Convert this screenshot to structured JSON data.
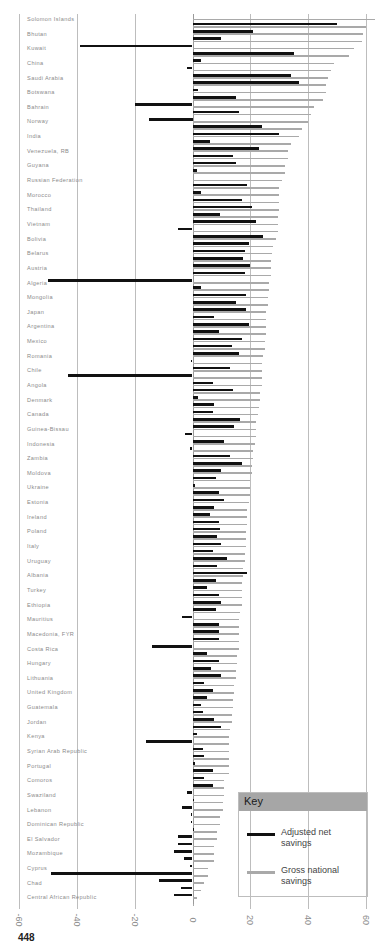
{
  "chart_data": {
    "type": "bar",
    "orientation": "horizontal",
    "title": "",
    "xlabel": "",
    "ylabel": "",
    "xlim": [
      -60,
      60
    ],
    "xticks": [
      "-60",
      "-40",
      "-20",
      "0",
      "20",
      "40",
      "60"
    ],
    "grid": true,
    "legend_position": "bottom-right",
    "legend_title": "Key",
    "series_names": [
      "Adjusted net savings",
      "Gross national savings"
    ],
    "series_colors": [
      "#111111",
      "#a9a9a9"
    ],
    "row_labels": [
      "Solomon Islands",
      "",
      "Bhutan",
      "",
      "Kuwait",
      "",
      "China",
      "",
      "Saudi Arabia",
      "",
      "Botswana",
      "",
      "Bahrain",
      "",
      "Norway",
      "",
      "India",
      "",
      "Venezuela, RB",
      "",
      "Guyana",
      "",
      "Russian Federation",
      "",
      "Morocco",
      "",
      "Thailand",
      "",
      "Vietnam",
      "",
      "Bolivia",
      "",
      "Belarus",
      "",
      "Austria",
      "",
      "Algeria",
      "",
      "Mongolia",
      "",
      "Japan",
      "",
      "Argentina",
      "",
      "Mexico",
      "",
      "Romania",
      "",
      "Chile",
      "",
      "Angola",
      "",
      "Denmark",
      "",
      "Canada",
      "",
      "Guinea-Bissau",
      "",
      "Indonesia",
      "",
      "Zambia",
      "",
      "Moldova",
      "",
      "Ukraine",
      "",
      "Estonia",
      "",
      "Ireland",
      "",
      "Poland",
      "",
      "Italy",
      "",
      "Uruguay",
      "",
      "Albania",
      "",
      "Turkey",
      "",
      "Ethiopia",
      "",
      "Mauritius",
      "",
      "Macedonia, FYR",
      "",
      "Costa Rica",
      "",
      "Hungary",
      "",
      "Lithuania",
      "",
      "United Kingdom",
      "",
      "Guatemala",
      "",
      "Jordan",
      "",
      "Kenya",
      "",
      "Syrian Arab Republic",
      "",
      "Portugal",
      "",
      "Comoros",
      "",
      "Swaziland",
      "",
      "Lebanon",
      "",
      "Dominican Republic",
      "",
      "El Salvador",
      "",
      "Mozambique",
      "",
      "Cyprus",
      "",
      "Chad",
      "",
      "Central African Republic",
      ""
    ],
    "series": [
      {
        "name": "Adjusted net savings",
        "values": [
          0,
          50,
          21,
          10,
          -39,
          35,
          3,
          -2,
          34,
          37,
          2,
          15,
          -20,
          16,
          -15,
          24,
          30,
          6,
          23,
          14,
          15,
          1.5,
          0,
          19,
          3,
          17,
          20.5,
          9.5,
          22,
          -5,
          24.5,
          19.5,
          18,
          17.5,
          20,
          18,
          -50,
          3,
          18.5,
          15,
          18.5,
          7.5,
          19.5,
          9,
          17,
          13.5,
          16,
          -0.5,
          13,
          -43,
          7,
          14,
          2,
          7.5,
          7,
          16.5,
          14.5,
          -2.5,
          11,
          -1,
          13,
          17,
          10,
          8,
          1,
          9,
          11,
          7.5,
          6,
          9,
          9.5,
          8.5,
          10,
          7,
          12,
          8.5,
          19,
          8,
          5,
          9,
          10,
          8,
          -3.5,
          9,
          9,
          9,
          -14,
          5,
          9,
          6.5,
          10,
          4,
          7,
          5,
          3,
          3.5,
          7.5,
          10,
          1.5,
          -16,
          3.5,
          4,
          1,
          7,
          4,
          7,
          -2,
          0.5,
          -3.5,
          -0.5,
          -0.5,
          0.5,
          -5,
          -5,
          -6.5,
          -3,
          -1,
          -49,
          -11.5,
          -4,
          -6.5
        ]
      },
      {
        "name": "Gross national savings",
        "values": [
          63,
          60,
          59,
          58.5,
          56,
          54,
          49,
          48,
          47,
          46,
          46,
          45,
          42,
          41,
          40,
          38,
          37,
          34,
          33,
          33,
          32,
          32,
          31,
          30,
          30,
          30,
          30,
          29.5,
          29.5,
          29.5,
          29,
          28,
          27.5,
          27,
          27,
          27,
          26.5,
          26.5,
          26,
          26,
          25.5,
          25.5,
          25.5,
          25.5,
          25,
          25,
          24.5,
          24,
          24,
          24,
          24,
          23.5,
          23.5,
          23,
          22.5,
          22,
          22,
          22,
          21.5,
          21,
          21,
          20.5,
          20.5,
          20,
          20,
          20,
          19.5,
          19,
          19,
          19,
          18.5,
          18.5,
          18.5,
          18,
          18,
          17.5,
          17.5,
          17,
          17,
          17,
          17,
          16.5,
          16,
          16,
          16,
          16,
          16,
          15.5,
          15.5,
          15,
          15,
          14.5,
          14.5,
          14,
          14,
          13.5,
          13.5,
          13,
          12.5,
          12.5,
          12.5,
          12.5,
          12.5,
          12.5,
          11,
          11,
          11,
          10.5,
          10.5,
          9.5,
          9.5,
          8.5,
          8.5,
          7.5,
          7.5,
          7.5,
          5.5,
          5.5,
          4,
          3,
          1.5,
          0.5
        ]
      }
    ]
  },
  "axis": {
    "ticks": [
      "-60",
      "-40",
      "-20",
      "0",
      "20",
      "40",
      "60"
    ]
  },
  "legend": {
    "title": "Key",
    "items": [
      {
        "label": "Adjusted net savings",
        "color": "#111111"
      },
      {
        "label": "Gross national savings",
        "color": "#a9a9a9"
      }
    ]
  },
  "footer": {
    "text": "448"
  }
}
